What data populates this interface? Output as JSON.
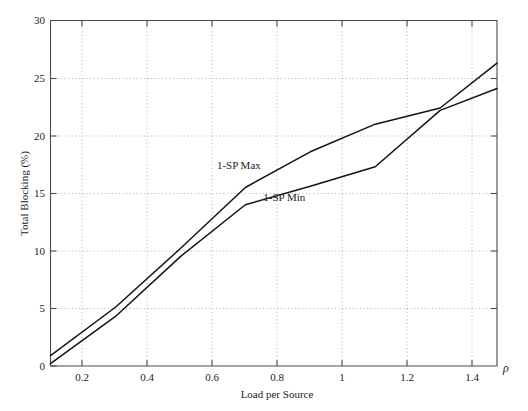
{
  "chart_data": {
    "type": "line",
    "title": "",
    "xlabel": "Load per Source",
    "ylabel": "Total Blocking (%)",
    "x_axis_symbol": "ρ",
    "xlim": [
      0.1,
      1.475
    ],
    "ylim": [
      0,
      30
    ],
    "xticks": [
      0.2,
      0.4,
      0.6,
      0.8,
      1,
      1.2,
      1.4
    ],
    "xtick_labels": [
      "0.2",
      "0.4",
      "0.6",
      "0.8",
      "1",
      "1.2",
      "1.4"
    ],
    "yticks": [
      0,
      5,
      10,
      15,
      20,
      25,
      30
    ],
    "ytick_labels": [
      "0",
      "5",
      "10",
      "15",
      "20",
      "25",
      "30"
    ],
    "grid": true,
    "grid_style": "dotted",
    "legend_position": "inline-annotations",
    "series": [
      {
        "name": "1-SP Max",
        "label_position": {
          "x": 0.68,
          "y": 17.1
        },
        "color": "#141414",
        "x": [
          0.1,
          0.3,
          0.5,
          0.7,
          0.9,
          1.1,
          1.3,
          1.475
        ],
        "y": [
          0.9,
          5.1,
          10.2,
          15.5,
          18.6,
          21.0,
          22.4,
          26.3
        ]
      },
      {
        "name": "1-SP Min",
        "label_position": {
          "x": 0.82,
          "y": 14.3
        },
        "color": "#141414",
        "x": [
          0.1,
          0.3,
          0.5,
          0.7,
          0.9,
          1.1,
          1.3,
          1.475
        ],
        "y": [
          0.2,
          4.3,
          9.5,
          14.0,
          15.6,
          17.3,
          22.2,
          24.1
        ]
      }
    ]
  }
}
